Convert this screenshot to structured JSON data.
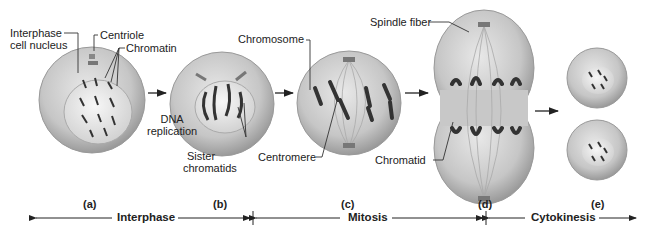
{
  "diagram": {
    "stages": [
      {
        "id": "a",
        "label": "(a)"
      },
      {
        "id": "b",
        "label": "(b)"
      },
      {
        "id": "c",
        "label": "(c)"
      },
      {
        "id": "d",
        "label": "(d)"
      },
      {
        "id": "e",
        "label": "(e)"
      }
    ],
    "callouts": {
      "interphase_nucleus": "Interphase",
      "interphase_nucleus_2": "cell nucleus",
      "centriole": "Centriole",
      "chromatin": "Chromatin",
      "dna": "DNA",
      "dna_2": "replication",
      "sister": "Sister",
      "sister_2": "chromatids",
      "chromosome": "Chromosome",
      "centromere": "Centromere",
      "spindle_fiber": "Spindle fiber",
      "chromatid": "Chromatid"
    },
    "phases": [
      {
        "label": "Interphase"
      },
      {
        "label": "Mitosis"
      },
      {
        "label": "Cytokinesis"
      }
    ],
    "colors": {
      "cell_fill": "#c9c9c9",
      "cell_edge": "#8f8f8f",
      "nucleus_fill": "#e6e6e6",
      "chromosome": "#2e2e2e",
      "line": "#222222"
    }
  }
}
